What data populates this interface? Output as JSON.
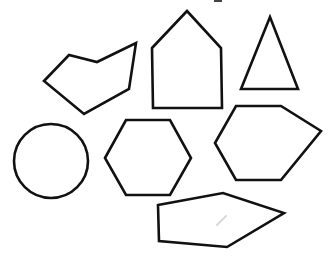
{
  "canvas": {
    "width": 335,
    "height": 262,
    "background": "#ffffff"
  },
  "style": {
    "stroke": "#111111",
    "fill": "#ffffff"
  },
  "shapes": [
    {
      "id": "irregular-hexagon-left",
      "type": "polygon",
      "sides": 6,
      "points": "44,81 69,55 97,62 136,43 129,89 84,114"
    },
    {
      "id": "house-pentagon",
      "type": "polygon",
      "sides": 5,
      "points": "152,48 187,11 221,48 222,108 153,108"
    },
    {
      "id": "triangle",
      "type": "polygon",
      "sides": 3,
      "points": "270,17 241,89 298,89"
    },
    {
      "id": "circle",
      "type": "circle",
      "cx": 51,
      "cy": 161,
      "r": 37
    },
    {
      "id": "regular-hexagon",
      "type": "polygon",
      "sides": 6,
      "points": "105,158 126,120 170,120 191,158 170,195 126,195"
    },
    {
      "id": "irregular-hexagon-right",
      "type": "polygon",
      "sides": 6,
      "points": "236,106 281,106 321,131 281,180 236,180 215,143"
    },
    {
      "id": "irregular-pentagon-bottom",
      "type": "polygon",
      "sides": 5,
      "points": "158,205 223,193 284,213 227,247 159,241"
    }
  ],
  "marks": {
    "top_mark": {
      "x": 214,
      "y": 0,
      "width": 8,
      "height": 2
    },
    "faint_line": {
      "x1": 217,
      "y1": 225,
      "x2": 226,
      "y2": 216
    }
  }
}
